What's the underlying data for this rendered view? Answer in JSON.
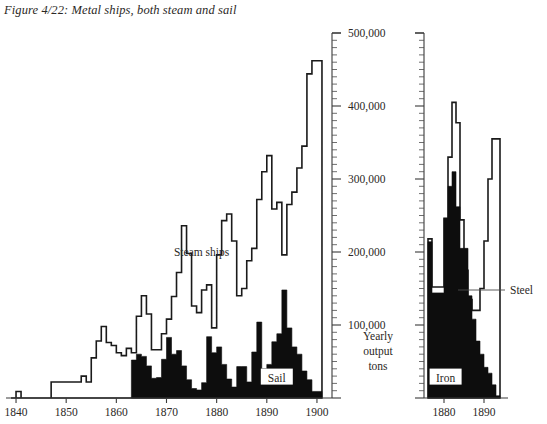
{
  "figure": {
    "title": "Figure 4/22: Metal ships, both steam and sail",
    "y_axis_label_lines": [
      "Yearly",
      "output",
      "tons"
    ]
  },
  "chart_data": [
    {
      "id": "left",
      "type": "area",
      "title": "Metal ships, both steam and sail",
      "xlabel": "",
      "ylabel": "Yearly output tons",
      "xlim": [
        1838,
        1903
      ],
      "ylim": [
        0,
        500000
      ],
      "xticks": [
        1840,
        1850,
        1860,
        1870,
        1880,
        1890,
        1900
      ],
      "xticklabels": [
        "1840",
        "1850",
        "1860",
        "1870",
        "1880",
        "1890",
        "1900"
      ],
      "yticks": [
        0,
        100000,
        200000,
        300000,
        400000,
        500000
      ],
      "yticklabels": [
        "",
        "100,000",
        "200,000",
        "300,000",
        "400,000",
        "500,000"
      ],
      "ytick_minor_step": 10000,
      "grid": false,
      "legend": "inline-annotations",
      "annotations": [
        {
          "text": "Steam ships",
          "x": 1877,
          "y": 200000,
          "boxed": false
        },
        {
          "text": "Sail",
          "x": 1892,
          "y": 28000,
          "boxed": true
        }
      ],
      "series": [
        {
          "name": "Steam ships",
          "style": "outline",
          "x": [
            1839,
            1840,
            1841,
            1842,
            1843,
            1844,
            1845,
            1846,
            1847,
            1848,
            1849,
            1850,
            1851,
            1852,
            1853,
            1854,
            1855,
            1856,
            1857,
            1858,
            1859,
            1860,
            1861,
            1862,
            1863,
            1864,
            1865,
            1866,
            1867,
            1868,
            1869,
            1870,
            1871,
            1872,
            1873,
            1874,
            1875,
            1876,
            1877,
            1878,
            1879,
            1880,
            1881,
            1882,
            1883,
            1884,
            1885,
            1886,
            1887,
            1888,
            1889,
            1890,
            1891,
            1892,
            1893,
            1894,
            1895,
            1896,
            1897,
            1898,
            1899,
            1900
          ],
          "values": [
            0,
            9000,
            0,
            0,
            0,
            0,
            0,
            0,
            22000,
            22000,
            22000,
            22000,
            22000,
            22000,
            30000,
            22000,
            55000,
            78000,
            98000,
            76000,
            72000,
            62000,
            58000,
            68000,
            62000,
            112000,
            140000,
            115000,
            66000,
            66000,
            88000,
            108000,
            139000,
            172000,
            236000,
            198000,
            126000,
            117000,
            148000,
            155000,
            96000,
            196000,
            243000,
            252000,
            215000,
            140000,
            150000,
            188000,
            205000,
            272000,
            310000,
            332000,
            259000,
            268000,
            196000,
            265000,
            282000,
            315000,
            345000,
            444000,
            462000,
            462000
          ]
        },
        {
          "name": "Sail",
          "style": "solid",
          "x": [
            1863,
            1864,
            1865,
            1866,
            1867,
            1868,
            1869,
            1870,
            1871,
            1872,
            1873,
            1874,
            1875,
            1876,
            1877,
            1878,
            1879,
            1880,
            1881,
            1882,
            1883,
            1884,
            1885,
            1886,
            1887,
            1888,
            1889,
            1890,
            1891,
            1892,
            1893,
            1894,
            1895,
            1896,
            1897,
            1898,
            1899,
            1900
          ],
          "values": [
            52000,
            60000,
            57000,
            44000,
            27000,
            28000,
            53000,
            83000,
            60000,
            65000,
            44000,
            25000,
            13000,
            11000,
            21000,
            84000,
            62000,
            70000,
            46000,
            26000,
            15000,
            43000,
            43000,
            22000,
            63000,
            104000,
            40000,
            46000,
            77000,
            88000,
            148000,
            96000,
            70000,
            60000,
            37000,
            25000,
            9000,
            9000
          ]
        }
      ]
    },
    {
      "id": "right",
      "type": "area",
      "title": "",
      "xlabel": "",
      "ylabel": "",
      "xlim": [
        1875,
        1894
      ],
      "ylim": [
        0,
        500000
      ],
      "xticks": [
        1880,
        1890
      ],
      "xticklabels": [
        "1880",
        "1890"
      ],
      "yticks": [
        0,
        100000,
        200000,
        300000,
        400000,
        500000
      ],
      "yticklabels": [
        "",
        "",
        "",
        "",
        "",
        ""
      ],
      "ytick_minor_step": 10000,
      "grid": false,
      "legend": "inline-annotations",
      "annotations": [
        {
          "text": "Iron",
          "x": 1880.4,
          "y": 28000,
          "boxed": true
        },
        {
          "text": "Steel",
          "x": 1896.5,
          "y": 148000,
          "boxed": false,
          "leader": true
        }
      ],
      "series": [
        {
          "name": "Steel",
          "style": "outline",
          "x": [
            1876,
            1877,
            1878,
            1879,
            1880,
            1881,
            1882,
            1883,
            1884,
            1885,
            1886,
            1887,
            1888,
            1889,
            1890,
            1891,
            1892,
            1893
          ],
          "values": [
            218000,
            152000,
            152000,
            152000,
            246000,
            330000,
            405000,
            377000,
            244000,
            175000,
            135000,
            120000,
            120000,
            150000,
            215000,
            300000,
            355000,
            355000
          ]
        },
        {
          "name": "Iron",
          "style": "solid",
          "x": [
            1876,
            1877,
            1878,
            1879,
            1880,
            1881,
            1882,
            1883,
            1884,
            1885,
            1886,
            1887,
            1888,
            1889,
            1890,
            1891,
            1892,
            1893
          ],
          "values": [
            214000,
            144000,
            144000,
            144000,
            246000,
            290000,
            310000,
            262000,
            205000,
            205000,
            140000,
            108000,
            78000,
            60000,
            42000,
            34000,
            18000,
            3000
          ]
        }
      ]
    }
  ],
  "axes_geometry": {
    "left_chart": {
      "x0": 6,
      "x1": 332,
      "y_base": 398,
      "y_top": 33,
      "axis_x": 332
    },
    "right_chart": {
      "x0": 424,
      "x1": 500,
      "y_base": 398,
      "y_top": 33,
      "axis_x": 424
    }
  }
}
